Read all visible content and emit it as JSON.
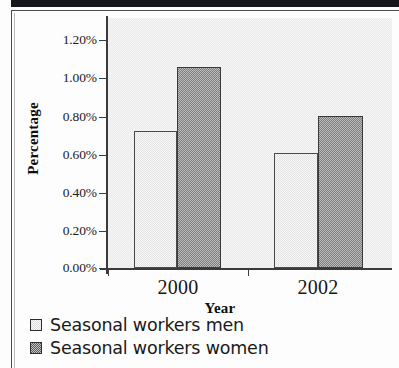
{
  "chart_data": {
    "type": "bar",
    "title": "",
    "subtitle": "",
    "xlabel": "Year",
    "ylabel": "Percentage",
    "categories": [
      "2000",
      "2002"
    ],
    "series": [
      {
        "name": "Seasonal workers men",
        "values": [
          0.72,
          0.605
        ],
        "color": "#ededed"
      },
      {
        "name": "Seasonal workers women",
        "values": [
          1.06,
          0.8
        ],
        "color": "#9c9c9c"
      }
    ],
    "ylim": [
      0.0,
      1.2
    ],
    "ytick_values": [
      0.0,
      0.2,
      0.4,
      0.6,
      0.8,
      1.0,
      1.2
    ],
    "ytick_labels": [
      "0.00%",
      "0.20%",
      "0.40%",
      "0.60%",
      "0.80%",
      "1.00%",
      "1.20%"
    ],
    "xtick_labels": [
      "2000",
      "2002"
    ],
    "value_unit": "%",
    "grid": false,
    "legend_position": "below-left",
    "plot_background": "#f0f0f0"
  },
  "axes": {
    "y_title": "Percentage",
    "x_title": "Year",
    "y_labels": [
      "1.20%",
      "1.00%",
      "0.80%",
      "0.60%",
      "0.40%",
      "0.20%",
      "0.00%"
    ],
    "x_labels": [
      "2000",
      "2002"
    ]
  },
  "legend": {
    "items": [
      {
        "label": "Seasonal workers men",
        "swatch": "light-square-icon"
      },
      {
        "label": "Seasonal workers women",
        "swatch": "dark-square-icon"
      }
    ]
  }
}
